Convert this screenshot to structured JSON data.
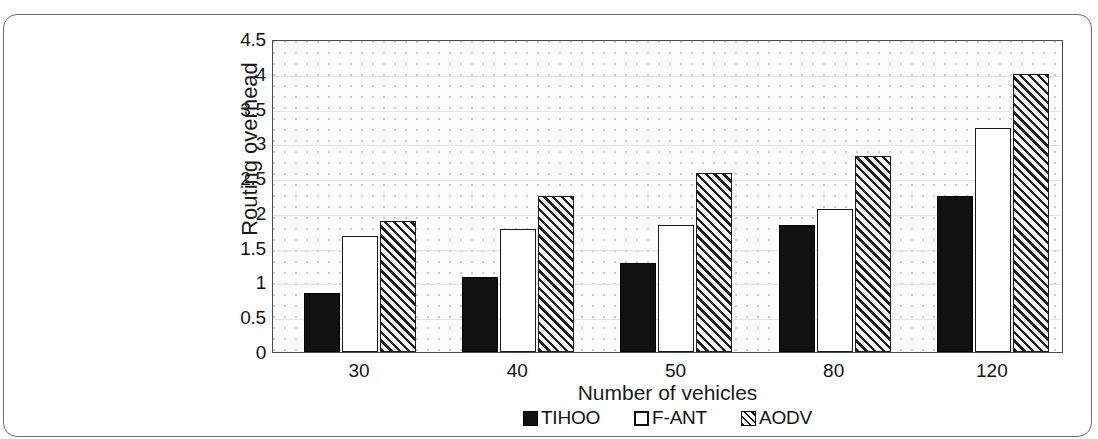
{
  "chart_data": {
    "type": "bar",
    "title": "",
    "xlabel": "Number of vehicles",
    "ylabel": "Routing overhead",
    "categories": [
      "30",
      "40",
      "50",
      "80",
      "120"
    ],
    "series": [
      {
        "name": "TIHOO",
        "values": [
          0.85,
          1.08,
          1.28,
          1.82,
          2.25
        ],
        "fill": "solid-black",
        "color": "#111111"
      },
      {
        "name": "F-ANT",
        "values": [
          1.67,
          1.77,
          1.82,
          2.05,
          3.22
        ],
        "fill": "white",
        "color": "#ffffff"
      },
      {
        "name": "AODV",
        "values": [
          1.88,
          2.25,
          2.58,
          2.82,
          4.0
        ],
        "fill": "diagonal-hatch",
        "color": "#f2f2f2"
      }
    ],
    "ylim": [
      0,
      4.5
    ],
    "ytick_values": [
      0,
      0.5,
      1,
      1.5,
      2,
      2.5,
      3,
      3.5,
      4,
      4.5
    ],
    "ytick_labels": [
      "0",
      "0.5",
      "1",
      "1.5",
      "2",
      "2.5",
      "3",
      "3.5",
      "4",
      "4.5"
    ],
    "grid": true,
    "grid_axis": "y",
    "legend_position": "bottom"
  },
  "axes": {
    "y_title": "Routing overhead",
    "x_title": "Number of vehicles"
  },
  "legend": {
    "items": [
      {
        "label": "TIHOO"
      },
      {
        "label": "F-ANT"
      },
      {
        "label": "AODV"
      }
    ]
  }
}
